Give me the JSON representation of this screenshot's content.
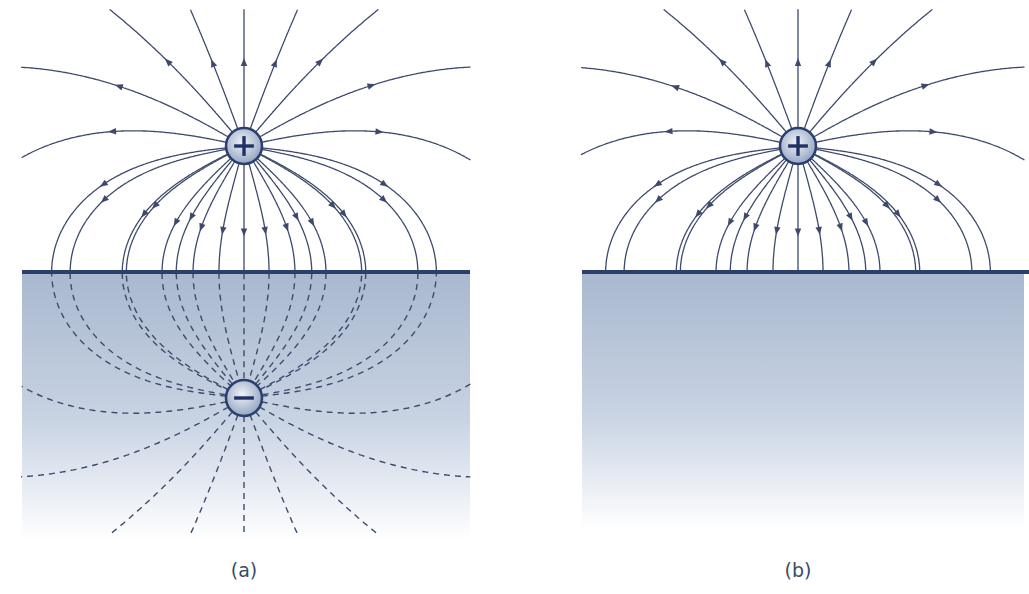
{
  "figure": {
    "colors": {
      "field_line": "#3d4a6b",
      "surface_line": "#2a3f6e",
      "conductor_top": "#a9b8cf",
      "conductor_bottom": "#ffffff",
      "charge_fill_center": "#eef2f8",
      "charge_fill_edge": "#8d9fbd",
      "charge_outline": "#2a3f6e",
      "caption": "#3b4a63"
    },
    "panels": [
      {
        "id": "a",
        "caption": "(a)",
        "caption_x": 244,
        "caption_y": 573,
        "surface_y": 272,
        "surface_x_range": [
          22,
          470
        ],
        "conductor_box": [
          22,
          272,
          448,
          268
        ],
        "real_charge": {
          "sign": "+",
          "label": "+",
          "x": 244,
          "y": 146,
          "r": 18
        },
        "image_charge": {
          "sign": "-",
          "label": "−",
          "x": 244,
          "y": 402,
          "r": 18,
          "shown": true
        },
        "show_image_field_lines": true,
        "field_lines_solid": "above surface, from + charge, arrows pointing away",
        "field_lines_dashed": "below surface, converging on image − charge"
      },
      {
        "id": "b",
        "caption": "(b)",
        "caption_x": 243,
        "caption_y": 573,
        "surface_y": 272,
        "surface_x_range": [
          27,
          474
        ],
        "conductor_box": [
          27,
          272,
          442,
          258
        ],
        "real_charge": {
          "sign": "+",
          "label": "+",
          "x": 243,
          "y": 146,
          "r": 18
        },
        "image_charge": {
          "shown": false
        },
        "show_image_field_lines": false,
        "field_lines_solid": "above surface, terminate perpendicularly on conductor"
      }
    ],
    "field_lines": {
      "count_total": 22,
      "surface_hit_x_offsets": [
        -174,
        -122,
        -82,
        -51,
        -25,
        0,
        25,
        51,
        82,
        122,
        174
      ],
      "upward_start_angles_deg": [
        0,
        22,
        44,
        66,
        88,
        108,
        128,
        145
      ],
      "arrow_count_per_line": 1
    }
  }
}
